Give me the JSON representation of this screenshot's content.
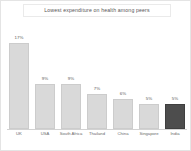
{
  "chart_data": {
    "type": "bar",
    "title": "Lowest expenditure on health among peers",
    "xlabel": "",
    "ylabel": "",
    "ylim": [
      0,
      18
    ],
    "grid": false,
    "legend": "none",
    "value_suffix": "%",
    "categories": [
      "UK",
      "USA",
      "South Africa",
      "Thailand",
      "China",
      "Singapore",
      "India"
    ],
    "values": [
      17,
      9,
      9,
      7,
      6,
      5,
      5
    ],
    "value_labels": [
      "17%",
      "9%",
      "9%",
      "7%",
      "6%",
      "5%",
      "5%"
    ],
    "highlight_index": 6,
    "colors": {
      "bar": "#d9d9d9",
      "bar_border": "#cccccc",
      "bar_highlight": "#4d4d4d",
      "bar_highlight_border": "#3f3f3f",
      "axis": "#d2d2d2",
      "title_text": "#555555",
      "label_text": "#6a6a6a",
      "value_text": "#5a5a5a",
      "background": "#ffffff",
      "card_border": "#e4e4e4"
    }
  }
}
